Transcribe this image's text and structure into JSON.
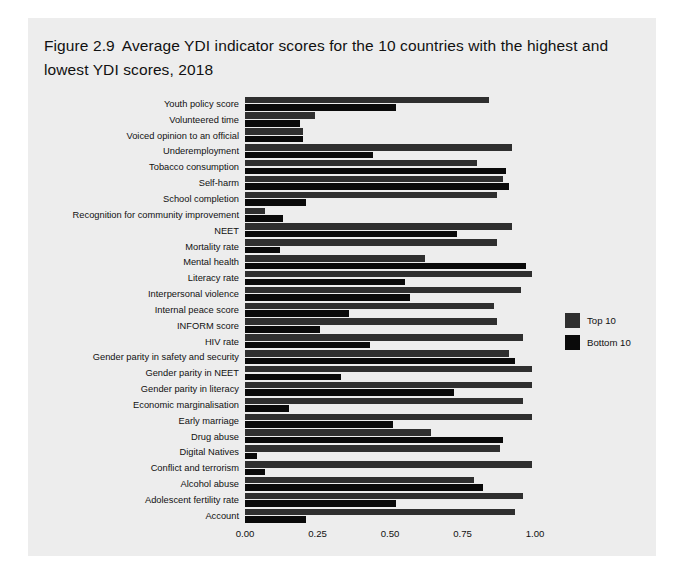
{
  "figure": {
    "number": "Figure 2.9",
    "title": "Average YDI indicator scores for the 10 countries with the highest and lowest YDI scores, 2018"
  },
  "legend": {
    "position": "right",
    "entries": [
      {
        "label": "Top 10",
        "color": "#2f2f2f"
      },
      {
        "label": "Bottom 10",
        "color": "#0a0a0a"
      }
    ]
  },
  "chart_data": {
    "type": "bar",
    "orientation": "horizontal",
    "xlabel": "",
    "ylabel": "",
    "xlim": [
      0.0,
      1.0
    ],
    "grid": false,
    "xticks": [
      0.0,
      0.25,
      0.5,
      0.75,
      1.0
    ],
    "xtick_labels": [
      "0.00",
      "0.25",
      "0.50",
      "0.75",
      "1.00"
    ],
    "categories": [
      "Youth policy score",
      "Volunteered time",
      "Voiced opinion to an official",
      "Underemployment",
      "Tobacco consumption",
      "Self-harm",
      "School completion",
      "Recognition for community improvement",
      "NEET",
      "Mortality rate",
      "Mental health",
      "Literacy rate",
      "Interpersonal violence",
      "Internal peace score",
      "INFORM score",
      "HIV rate",
      "Gender parity in safety and security",
      "Gender parity in NEET",
      "Gender parity in literacy",
      "Economic marginalisation",
      "Early marriage",
      "Drug abuse",
      "Digital Natives",
      "Conflict and terrorism",
      "Alcohol abuse",
      "Adolescent fertility rate",
      "Account"
    ],
    "series": [
      {
        "name": "Top 10",
        "color": "#2f2f2f",
        "values": [
          0.84,
          0.24,
          0.2,
          0.92,
          0.8,
          0.89,
          0.87,
          0.07,
          0.92,
          0.87,
          0.62,
          0.99,
          0.95,
          0.86,
          0.87,
          0.96,
          0.91,
          0.99,
          0.99,
          0.96,
          0.99,
          0.64,
          0.88,
          0.99,
          0.79,
          0.96,
          0.93
        ]
      },
      {
        "name": "Bottom 10",
        "color": "#0a0a0a",
        "values": [
          0.52,
          0.19,
          0.2,
          0.44,
          0.9,
          0.91,
          0.21,
          0.13,
          0.73,
          0.12,
          0.97,
          0.55,
          0.57,
          0.36,
          0.26,
          0.43,
          0.93,
          0.33,
          0.72,
          0.15,
          0.51,
          0.89,
          0.04,
          0.07,
          0.82,
          0.52,
          0.21
        ]
      }
    ]
  }
}
